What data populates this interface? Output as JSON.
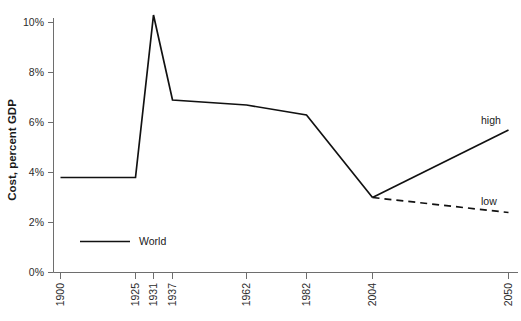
{
  "chart_data": {
    "type": "line",
    "title": "",
    "xlabel": "",
    "ylabel": "Cost, percent GDP",
    "categories": [
      "1900",
      "1925",
      "1931",
      "1937",
      "1962",
      "1982",
      "2004",
      "2050"
    ],
    "ylim": [
      0,
      10
    ],
    "ytick_labels": [
      "0%",
      "2%",
      "4%",
      "6%",
      "8%",
      "10%"
    ],
    "ytick_values": [
      0,
      2,
      4,
      6,
      8,
      10
    ],
    "grid": false,
    "legend_position": "inside-bottom-left",
    "series": [
      {
        "name": "World",
        "style": "solid",
        "x": [
          "1900",
          "1925",
          "1931",
          "1937",
          "1962",
          "1982",
          "2004"
        ],
        "values": [
          3.8,
          3.8,
          10.3,
          6.9,
          6.7,
          6.3,
          3.0
        ]
      },
      {
        "name": "high",
        "style": "solid",
        "x": [
          "2004",
          "2050"
        ],
        "values": [
          3.0,
          5.7
        ]
      },
      {
        "name": "low",
        "style": "dashed",
        "x": [
          "2004",
          "2050"
        ],
        "values": [
          3.0,
          2.4
        ]
      }
    ],
    "annotations": [
      {
        "text": "high",
        "value": 5.7,
        "at": "2050"
      },
      {
        "text": "low",
        "value": 2.4,
        "at": "2050"
      }
    ]
  },
  "axis": {
    "y_title": "Cost, percent GDP",
    "y_ticks": [
      {
        "label": "10%",
        "value": 10
      },
      {
        "label": "8%",
        "value": 8
      },
      {
        "label": "6%",
        "value": 6
      },
      {
        "label": "4%",
        "value": 4
      },
      {
        "label": "2%",
        "value": 2
      },
      {
        "label": "0%",
        "value": 0
      }
    ],
    "x_ticks": [
      {
        "label": "1900"
      },
      {
        "label": "1925"
      },
      {
        "label": "1931"
      },
      {
        "label": "1937"
      },
      {
        "label": "1962"
      },
      {
        "label": "1982"
      },
      {
        "label": "2004"
      },
      {
        "label": "2050"
      }
    ]
  },
  "legend": {
    "entries": [
      {
        "label": "World"
      }
    ]
  },
  "labels": {
    "high": "high",
    "low": "low"
  },
  "colors": {
    "line": "#111111",
    "axis": "#6e6e6e",
    "text": "#1a1a1a",
    "background": "#ffffff"
  }
}
